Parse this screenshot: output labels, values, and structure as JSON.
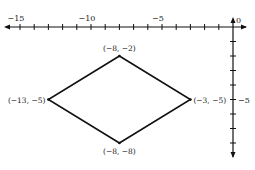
{
  "chart_data": {
    "type": "line",
    "title": "",
    "xlabel": "",
    "ylabel": "",
    "xlim": [
      -15,
      0
    ],
    "ylim": [
      -9,
      0
    ],
    "grid": false,
    "legend": null,
    "x_tick_labels": [
      {
        "value": -15,
        "label": "−15"
      },
      {
        "value": -10,
        "label": "−10"
      },
      {
        "value": -5,
        "label": "−5"
      },
      {
        "value": 0,
        "label": "0"
      }
    ],
    "x_ticks": [
      -15,
      -14,
      -13,
      -12,
      -11,
      -10,
      -9,
      -8,
      -7,
      -6,
      -5,
      -4,
      -3,
      -2,
      -1
    ],
    "y_tick_labels": [
      {
        "value": -5,
        "label": "−5"
      }
    ],
    "y_ticks": [
      -1,
      -2,
      -3,
      -4,
      -5,
      -6,
      -7,
      -8
    ],
    "series": [
      {
        "name": "rhombus",
        "closed": true,
        "points": [
          {
            "x": -8,
            "y": -2,
            "label": "(−8, −2)"
          },
          {
            "x": -3,
            "y": -5,
            "label": "(−3, −5)"
          },
          {
            "x": -8,
            "y": -8,
            "label": "(−8, −8)"
          },
          {
            "x": -13,
            "y": -5,
            "label": "(−13, −5)"
          }
        ]
      }
    ]
  },
  "style": {
    "stroke": "#111111",
    "background": "#ffffff"
  }
}
